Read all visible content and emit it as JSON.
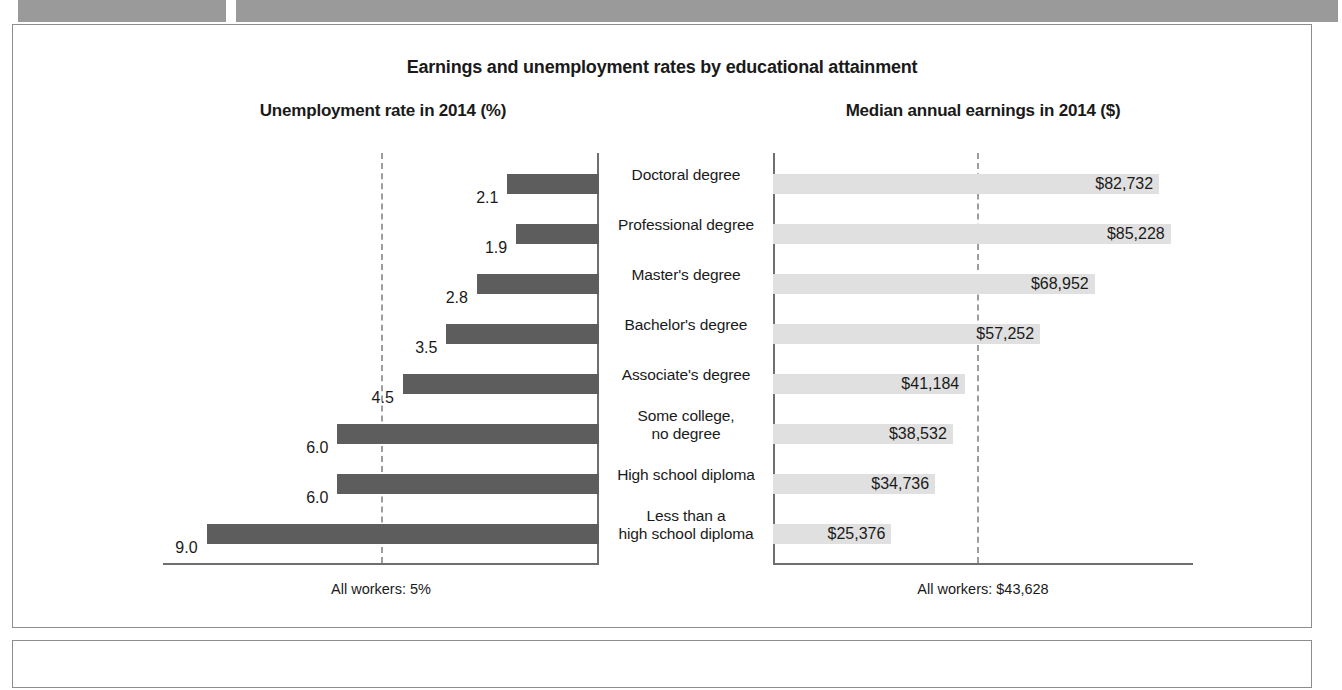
{
  "document": {
    "header_bars": [
      "",
      ""
    ],
    "footer_panel_text": ""
  },
  "chart_data": {
    "type": "bar",
    "title": "Earnings and unemployment rates by educational attainment",
    "orientation": "horizontal",
    "layout": "butterfly-diverging",
    "panels": [
      {
        "id": "unemployment",
        "subtitle": "Unemployment rate in 2014 (%)",
        "xlabel": "",
        "ylabel": "",
        "axis_direction": "right-to-left",
        "xlim": [
          0,
          10
        ],
        "grid": false,
        "reference_line": {
          "value": 5,
          "style": "dashed",
          "label": "All workers: 5%"
        },
        "bar_color": "#5d5d5d",
        "footnote": "All workers: 5%",
        "values": [
          2.1,
          1.9,
          2.8,
          3.5,
          4.5,
          6.0,
          6.0,
          9.0
        ],
        "value_labels": [
          "2.1",
          "1.9",
          "2.8",
          "3.5",
          "4.5",
          "6.0",
          "6.0",
          "9.0"
        ]
      },
      {
        "id": "earnings",
        "subtitle": "Median annual earnings in 2014 ($)",
        "xlabel": "",
        "ylabel": "",
        "axis_direction": "left-to-right",
        "xlim": [
          0,
          90000
        ],
        "grid": false,
        "reference_line": {
          "value": 43628,
          "style": "dashed",
          "label": "All workers: $43,628"
        },
        "bar_color": "#e0e0e0",
        "footnote": "All workers: $43,628",
        "values": [
          82732,
          85228,
          68952,
          57252,
          41184,
          38532,
          34736,
          25376
        ],
        "value_labels": [
          "$82,732",
          "$85,228",
          "$68,952",
          "$57,252",
          "$41,184",
          "$38,532",
          "$34,736",
          "$25,376"
        ]
      }
    ],
    "categories": [
      "Doctoral degree",
      "Professional degree",
      "Master's degree",
      "Bachelor's degree",
      "Associate's degree",
      "Some college,\nno degree",
      "High school diploma",
      "Less than a\nhigh school diploma"
    ]
  },
  "colors": {
    "unemployment_bar": "#5d5d5d",
    "earnings_bar": "#e0e0e0",
    "axis": "#6e6e6e",
    "reference_line": "#9d9d9d",
    "frame": "#8d8d8d",
    "header_bar": "#9a9a9a",
    "text": "#1a1a1a"
  }
}
